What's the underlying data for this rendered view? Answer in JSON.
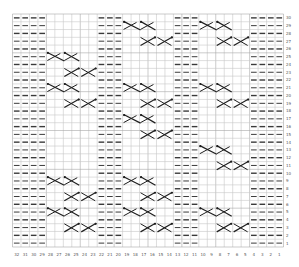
{
  "title": "",
  "chart": {
    "type": "knitting-chart",
    "columns": 32,
    "rows": 30,
    "column_labels": [
      32,
      31,
      30,
      29,
      28,
      27,
      26,
      25,
      24,
      23,
      22,
      21,
      20,
      19,
      18,
      17,
      16,
      15,
      14,
      13,
      12,
      11,
      10,
      9,
      8,
      7,
      6,
      5,
      4,
      3,
      2,
      1
    ],
    "row_labels": [
      30,
      29,
      28,
      27,
      26,
      25,
      24,
      23,
      22,
      21,
      20,
      19,
      18,
      17,
      16,
      15,
      14,
      13,
      12,
      11,
      10,
      9,
      8,
      7,
      6,
      5,
      4,
      3,
      2,
      1
    ],
    "purl_columns": [
      32,
      31,
      30,
      29,
      22,
      21,
      20,
      13,
      12,
      11,
      4,
      3,
      2,
      1
    ],
    "panels": [
      {
        "name": "cable-panel-left",
        "columns": [
          28,
          27,
          26,
          25,
          24,
          23
        ],
        "right_cross_rows": [
          25,
          21,
          9,
          5
        ],
        "left_cross_rows": [
          23,
          19,
          7,
          3
        ]
      },
      {
        "name": "cable-panel-middle",
        "columns": [
          19,
          18,
          17,
          16,
          15,
          14
        ],
        "right_cross_rows": [
          29,
          21,
          17,
          9,
          5
        ],
        "left_cross_rows": [
          27,
          19,
          15,
          7,
          3
        ]
      },
      {
        "name": "cable-panel-right",
        "columns": [
          10,
          9,
          8,
          7,
          6,
          5
        ],
        "right_cross_rows": [
          29,
          21,
          13,
          5
        ],
        "left_cross_rows": [
          27,
          19,
          11,
          3
        ]
      }
    ],
    "colors": {
      "grid": "#c8c8c8",
      "grid_major": "#a8a8a8",
      "purl": "#3a3a3a",
      "cable": "#1e1e1e",
      "label": "#555555"
    }
  }
}
